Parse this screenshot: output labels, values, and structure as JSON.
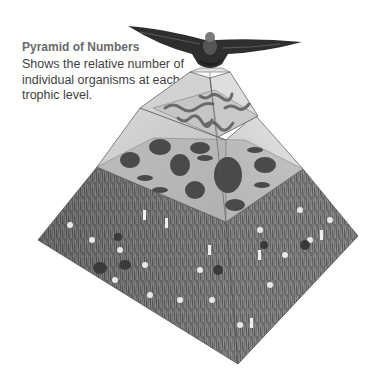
{
  "figure": {
    "title": "Pyramid of Numbers",
    "description": "Shows the relative number of individual organisms at each trophic level."
  },
  "pyramid": {
    "levels": [
      {
        "name": "top-carnivore",
        "organism": "eagle",
        "count_relative": 1
      },
      {
        "name": "carnivores",
        "organism": "snakes",
        "count_relative": 10
      },
      {
        "name": "herbivores",
        "organism": "rodents, rabbit, grasshoppers",
        "count_relative": 20
      },
      {
        "name": "producers",
        "organism": "grasses and flowers",
        "count_relative": 200
      }
    ]
  },
  "colors": {
    "title": "#6a6a6a",
    "body": "#3f3f3f",
    "grass_dark": "#5a5a5a",
    "grass_light": "#8c8c8c",
    "panel_light": "#cfcfcf",
    "panel_mid": "#b6b6b6"
  }
}
